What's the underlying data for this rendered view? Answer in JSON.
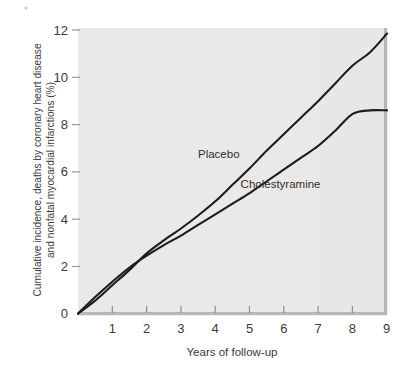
{
  "chart_data": {
    "type": "line",
    "title": "",
    "xlabel": "Years of follow-up",
    "ylabel": "Cumulative incidence, deaths by coronary heart disease and nonfatal myocardial infarctions (%)",
    "ylabel_line1": "Cumulative incidence, deaths by coronary heart disease",
    "ylabel_line2": "and nonfatal myocardial infarctions (%)",
    "xlim": [
      0,
      9
    ],
    "ylim": [
      0,
      12
    ],
    "xticks": [
      0,
      1,
      2,
      3,
      4,
      5,
      6,
      7,
      8,
      9
    ],
    "xtick_labels": [
      "0",
      "1",
      "2",
      "3",
      "4",
      "5",
      "6",
      "7",
      "8",
      "9"
    ],
    "yticks": [
      0,
      2,
      4,
      6,
      8,
      10,
      12
    ],
    "ytick_labels": [
      "0",
      "2",
      "4",
      "6",
      "8",
      "10",
      "12"
    ],
    "grid": false,
    "legend_position": "inline-annotations",
    "x": [
      0,
      0.5,
      1,
      1.5,
      2,
      2.5,
      3,
      3.5,
      4,
      4.5,
      5,
      5.5,
      6,
      6.5,
      7,
      7.5,
      8,
      8.5,
      9
    ],
    "series": [
      {
        "name": "Placebo",
        "color": "#1e1c1b",
        "label_x": 4.1,
        "label_y": 6.6,
        "values": [
          0.0,
          0.55,
          1.2,
          1.85,
          2.55,
          3.1,
          3.6,
          4.15,
          4.75,
          5.45,
          6.15,
          6.9,
          7.6,
          8.3,
          9.0,
          9.75,
          10.5,
          11.05,
          11.85
        ]
      },
      {
        "name": "Cholestyramine",
        "color": "#1e1c1b",
        "label_x": 5.9,
        "label_y": 5.3,
        "values": [
          0.0,
          0.7,
          1.35,
          1.95,
          2.45,
          2.9,
          3.3,
          3.75,
          4.2,
          4.65,
          5.1,
          5.6,
          6.1,
          6.6,
          7.1,
          7.75,
          8.45,
          8.6,
          8.6
        ]
      }
    ],
    "annotations": [
      {
        "text": "Placebo",
        "x": 4.1,
        "y": 6.6
      },
      {
        "text": "Cholestyramine",
        "x": 5.9,
        "y": 5.3
      }
    ],
    "colors": {
      "plot_background": "#ebe9e7",
      "axis": "#b9b7b5",
      "curve": "#1e1c1b",
      "page_background": "#ffffff"
    }
  }
}
